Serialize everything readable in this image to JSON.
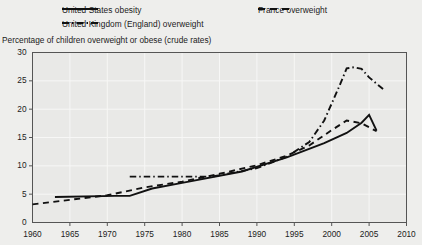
{
  "chart_data": {
    "type": "line",
    "title": "",
    "ylabel": "Percentage of children overweight or obese (crude rates)",
    "xlabel": "",
    "xlim": [
      1960,
      2010
    ],
    "ylim": [
      0,
      30
    ],
    "grid": true,
    "legend_position": "top",
    "xticks": [
      "1960",
      "1965",
      "1970",
      "1975",
      "1980",
      "1985",
      "1990",
      "1995",
      "2000",
      "2005",
      "2010"
    ],
    "yticks": [
      "0",
      "5",
      "10",
      "15",
      "20",
      "25",
      "30"
    ],
    "series": [
      {
        "name": "United States obesity",
        "style": "solid",
        "color": "#111111",
        "x": [
          1963,
          1971,
          1973,
          1976,
          1980,
          1988,
          1994,
          1999,
          2002,
          2004,
          2005,
          2006
        ],
        "y": [
          4.5,
          4.7,
          4.7,
          6.0,
          7.0,
          9.0,
          11.5,
          14.0,
          15.8,
          17.6,
          19.0,
          16.2
        ]
      },
      {
        "name": "France overweight",
        "style": "dashed",
        "color": "#111111",
        "x": [
          1960,
          1965,
          1970,
          1975,
          1980,
          1985,
          1990,
          1994,
          1997,
          2000,
          2002,
          2004,
          2006
        ],
        "y": [
          3.2,
          4.0,
          4.8,
          6.2,
          7.2,
          8.6,
          10.1,
          11.8,
          13.6,
          16.3,
          18.0,
          17.5,
          16.1
        ]
      },
      {
        "name": "United Kingdom (England) overweight",
        "style": "dashdot",
        "color": "#111111",
        "x": [
          1973,
          1980,
          1984,
          1990,
          1994,
          1997,
          1999,
          2001,
          2002,
          2003,
          2004,
          2005,
          2007
        ],
        "y": [
          8.1,
          8.1,
          8.1,
          9.6,
          11.6,
          14.2,
          18.0,
          24.0,
          27.2,
          27.4,
          27.1,
          25.6,
          23.4
        ]
      }
    ]
  },
  "legend": {
    "us_label": "United States obesity",
    "uk_label": "United Kingdom (England) overweight",
    "fr_label": "France overweight"
  },
  "axis": {
    "y_title": "Percentage of children overweight or obese (crude rates)"
  },
  "colors": {
    "background": "#eeeeec",
    "plot_background": "#e9e9e7",
    "line": "#111111",
    "axis": "#555555",
    "grid": "#f7f7f6"
  }
}
